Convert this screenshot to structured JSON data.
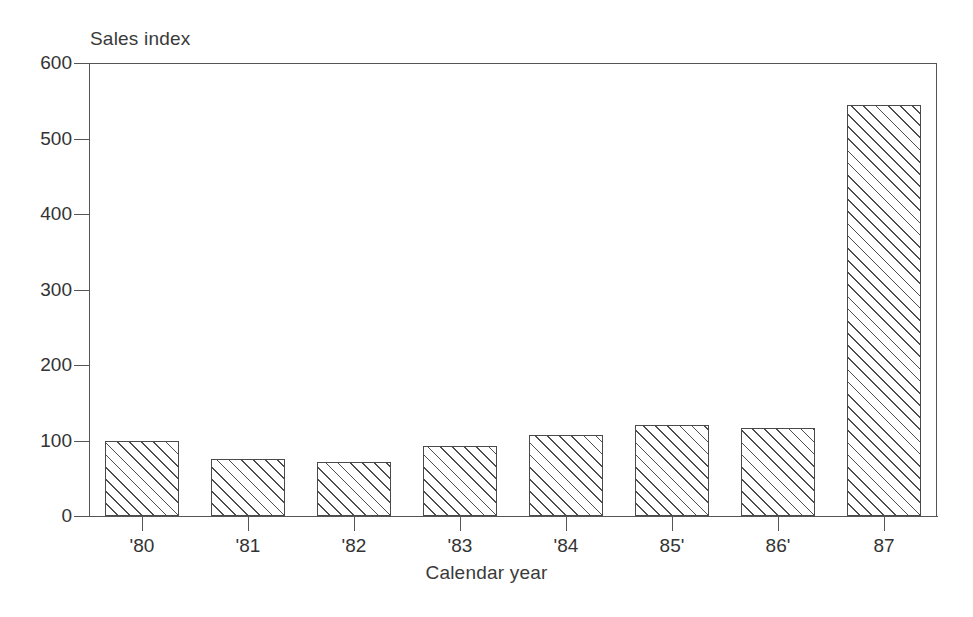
{
  "chart_data": {
    "type": "bar",
    "title": "",
    "subtitle": "",
    "ylabel": "Sales index",
    "xlabel": "Calendar year",
    "categories": [
      "'80",
      "'81",
      "'82",
      "'83",
      "'84",
      "85'",
      "86'",
      "87"
    ],
    "values": [
      100,
      76,
      72,
      93,
      107,
      120,
      117,
      545
    ],
    "ylim": [
      0,
      600
    ],
    "yticks": [
      0,
      100,
      200,
      300,
      400,
      500,
      600
    ],
    "ytick_labels": [
      "0",
      "100",
      "200",
      "300",
      "400",
      "500",
      "600"
    ],
    "grid": false,
    "legend": "none",
    "bar_fill": "diagonal-hatch",
    "line_color": "#4a4a4a",
    "background_color": "#ffffff"
  }
}
